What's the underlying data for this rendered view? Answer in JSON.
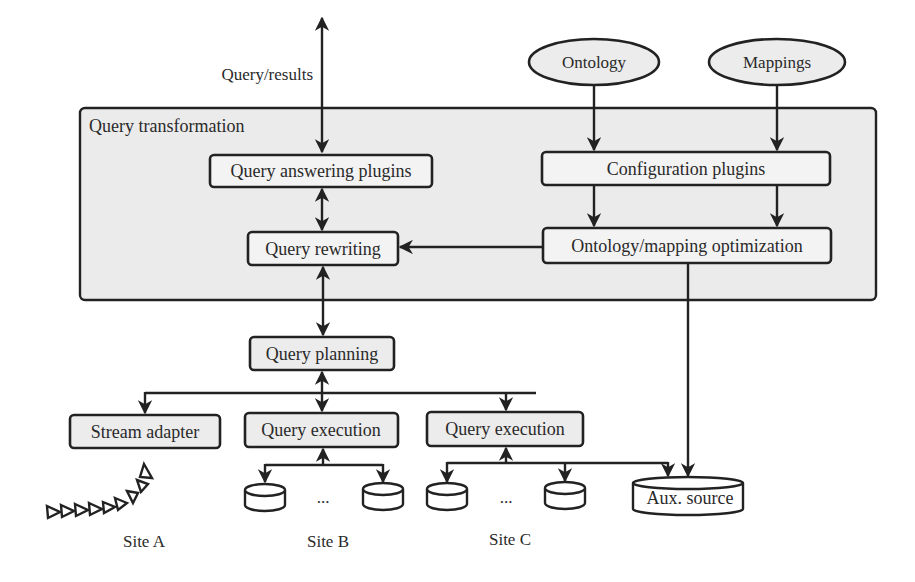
{
  "diagram": {
    "query_results_label": "Query/results",
    "inputs": [
      {
        "id": "ontology",
        "label": "Ontology"
      },
      {
        "id": "mappings",
        "label": "Mappings"
      }
    ],
    "container": {
      "label": "Query transformation"
    },
    "components": {
      "query_answering_plugins": "Query answering plugins",
      "configuration_plugins": "Configuration plugins",
      "query_rewriting": "Query rewriting",
      "ontology_mapping_optimization": "Ontology/mapping optimization",
      "query_planning": "Query planning",
      "stream_adapter": "Stream adapter",
      "query_execution_b": "Query execution",
      "query_execution_c": "Query execution"
    },
    "aux_source": "Aux. source",
    "ellipsis": "...",
    "sites": [
      {
        "id": "site-a",
        "label": "Site A"
      },
      {
        "id": "site-b",
        "label": "Site B"
      },
      {
        "id": "site-c",
        "label": "Site C"
      }
    ],
    "colors": {
      "box_fill": "#ececec",
      "container_fill": "#ebebeb",
      "stroke": "#222222",
      "text": "#2a2a2a"
    }
  }
}
